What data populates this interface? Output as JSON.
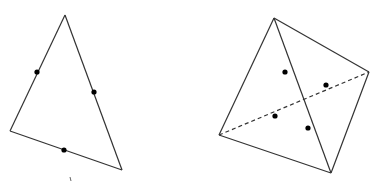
{
  "figures": [
    {
      "name": "triangle",
      "vertices": [
        [
          65,
          15
        ],
        [
          10,
          131
        ],
        [
          122,
          170
        ]
      ],
      "edges": [
        {
          "from": [
            65,
            15
          ],
          "to": [
            10,
            131
          ],
          "style": "solid"
        },
        {
          "from": [
            10,
            131
          ],
          "to": [
            122,
            170
          ],
          "style": "solid"
        },
        {
          "from": [
            122,
            170
          ],
          "to": [
            65,
            15
          ],
          "style": "solid"
        }
      ],
      "points": [
        [
          37,
          72
        ],
        [
          94,
          92
        ],
        [
          64,
          150
        ]
      ]
    },
    {
      "name": "tetrahedron",
      "vertices": [
        [
          274,
          18
        ],
        [
          369,
          72
        ],
        [
          219,
          135
        ],
        [
          331,
          173
        ]
      ],
      "edges": [
        {
          "from": [
            274,
            18
          ],
          "to": [
            219,
            135
          ],
          "style": "solid"
        },
        {
          "from": [
            274,
            18
          ],
          "to": [
            369,
            72
          ],
          "style": "solid"
        },
        {
          "from": [
            274,
            18
          ],
          "to": [
            331,
            173
          ],
          "style": "solid"
        },
        {
          "from": [
            219,
            135
          ],
          "to": [
            331,
            173
          ],
          "style": "solid"
        },
        {
          "from": [
            369,
            72
          ],
          "to": [
            331,
            173
          ],
          "style": "solid"
        },
        {
          "from": [
            219,
            135
          ],
          "to": [
            369,
            72
          ],
          "style": "dashed"
        }
      ],
      "points": [
        [
          285,
          72
        ],
        [
          326,
          85
        ],
        [
          275,
          116
        ],
        [
          308,
          128
        ]
      ]
    }
  ],
  "colors": {
    "stroke": "#333333",
    "point": "#000000",
    "background": "#ffffff"
  }
}
